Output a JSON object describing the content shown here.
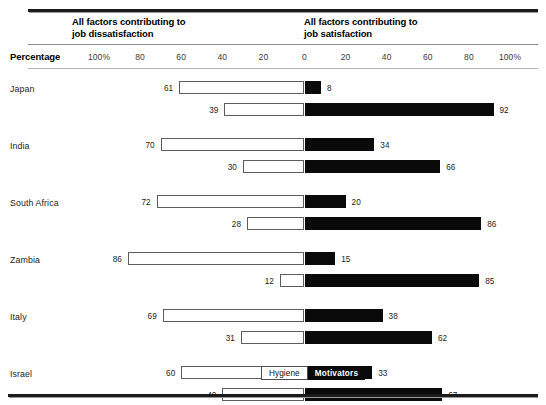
{
  "headers": {
    "left": "All factors contributing to\njob dissatisfaction",
    "right": "All factors contributing to\njob satisfaction"
  },
  "axis": {
    "label": "Percentage",
    "ticks": [
      "100%",
      "80",
      "60",
      "40",
      "20",
      "0",
      "20",
      "40",
      "60",
      "80",
      "100%"
    ]
  },
  "legend": {
    "hygiene": "Hygiene",
    "motivators": "Motivators"
  },
  "colors": {
    "hygiene": "#ffffff",
    "motivators": "#0a0a0a",
    "rule": "#1a1a1a",
    "text": "#1c1c1c"
  },
  "chart_data": {
    "type": "bar",
    "title": "",
    "subtitle": "",
    "orientation": "horizontal",
    "style": "diverging-stacked",
    "xlabel": "Percentage",
    "ylabel": "",
    "xlim": [
      -100,
      100
    ],
    "grid": false,
    "legend_position": "bottom-center",
    "axis_center": 0,
    "left_axis_title": "All factors contributing to job dissatisfaction",
    "right_axis_title": "All factors contributing to job satisfaction",
    "series": [
      {
        "name": "Hygiene",
        "side": "left"
      },
      {
        "name": "Motivators",
        "side": "right"
      }
    ],
    "categories": [
      "Japan",
      "India",
      "South Africa",
      "Zambia",
      "Italy",
      "Israel"
    ],
    "groups": [
      {
        "category": "Japan",
        "bars": [
          {
            "hygiene": 61,
            "motivators": 8
          },
          {
            "hygiene": 39,
            "motivators": 92
          }
        ]
      },
      {
        "category": "India",
        "bars": [
          {
            "hygiene": 70,
            "motivators": 34
          },
          {
            "hygiene": 30,
            "motivators": 66
          }
        ]
      },
      {
        "category": "South Africa",
        "bars": [
          {
            "hygiene": 72,
            "motivators": 20
          },
          {
            "hygiene": 28,
            "motivators": 86
          }
        ]
      },
      {
        "category": "Zambia",
        "bars": [
          {
            "hygiene": 86,
            "motivators": 15
          },
          {
            "hygiene": 12,
            "motivators": 85
          }
        ]
      },
      {
        "category": "Italy",
        "bars": [
          {
            "hygiene": 69,
            "motivators": 38
          },
          {
            "hygiene": 31,
            "motivators": 62
          }
        ]
      },
      {
        "category": "Israel",
        "bars": [
          {
            "hygiene": 60,
            "motivators": 33
          },
          {
            "hygiene": 40,
            "motivators": 67
          }
        ]
      }
    ]
  }
}
